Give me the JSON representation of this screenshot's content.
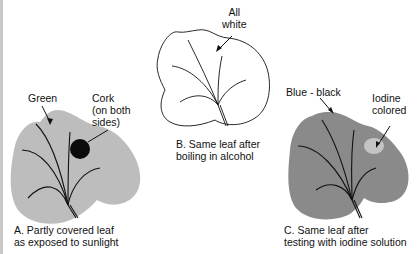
{
  "colors": {
    "leaf_a_fill": "#bdbdbd",
    "cork_fill": "#0a0a0a",
    "leaf_b_fill": "#ffffff",
    "leaf_c_fill": "#8a8a8a",
    "iodine_spot_fill": "#c4c4c4",
    "line": "#111111"
  },
  "panels": [
    {
      "id": "A",
      "caption_line1": "A.  Partly covered leaf",
      "caption_line2": "as exposed to sunlight",
      "labels": [
        {
          "text": "Green"
        },
        {
          "text_line1": "Cork",
          "text_line2": "(on both",
          "text_line3": "sides)"
        }
      ]
    },
    {
      "id": "B",
      "caption_line1": "B.  Same leaf after",
      "caption_line2": "boiling in alcohol",
      "labels": [
        {
          "text_line1": "All",
          "text_line2": "white"
        }
      ]
    },
    {
      "id": "C",
      "caption_line1": "C.  Same leaf after",
      "caption_line2": "testing with iodine solution",
      "labels": [
        {
          "text": "Blue - black"
        },
        {
          "text_line1": "Iodine",
          "text_line2": "colored"
        }
      ]
    }
  ]
}
